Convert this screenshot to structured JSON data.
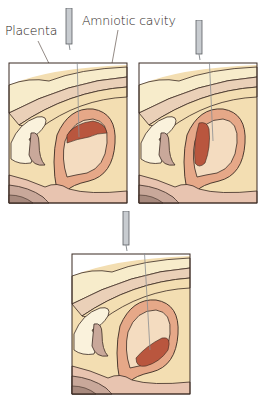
{
  "labels": {
    "placenta": "Placenta",
    "amniotic_cavity": "Amniotic cavity"
  },
  "panels": [
    {
      "id": "panel-1",
      "placenta_position": "anterior-top"
    },
    {
      "id": "panel-2",
      "placenta_position": "posterior-side"
    },
    {
      "id": "panel-3",
      "placenta_position": "fundal-bottom"
    }
  ],
  "colors": {
    "skin": "#f3deb2",
    "abdominal_wall_light": "#f7eccb",
    "muscle_band": "#ead0b8",
    "uterine_wall": "#e6a888",
    "amniotic_fluid": "#f4dcc0",
    "placenta": "#b9563e",
    "bladder": "#faf2dc",
    "rectum": "#c9a89a",
    "outline": "#3a2a22",
    "needle": "#b8bcc0"
  }
}
